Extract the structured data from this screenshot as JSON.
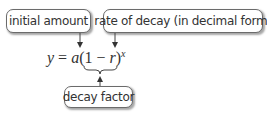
{
  "labels": {
    "initial_amount": "initial amount",
    "rate_of_decay": "rate of decay (in decimal form)",
    "decay_factor": "decay factor"
  },
  "equation": {
    "lhs": "y",
    "equals": " = ",
    "a": "a",
    "open": "(1 − ",
    "r": "r",
    "close": ")",
    "exponent": "x",
    "full": "y = a(1 − r)^x"
  },
  "colors": {
    "border": "#6b6b6b",
    "text": "#333333",
    "arrow": "#333333"
  }
}
